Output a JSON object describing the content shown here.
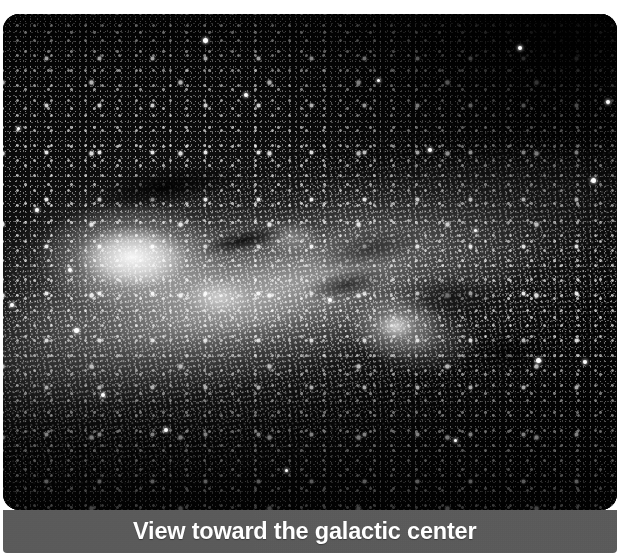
{
  "figure": {
    "kind": "astrophotograph",
    "color_mode": "grayscale",
    "caption": "View toward the galactic center",
    "plate": {
      "background_color": "#050505",
      "corner_radius_px": 16,
      "left": 3,
      "top": 14,
      "width": 614,
      "height": 496
    },
    "caption_bar": {
      "background_color": "#595959",
      "text_color": "#ffffff",
      "left": 3,
      "top": 510,
      "width": 614,
      "height": 43
    },
    "page_background_color": "#ffffff"
  },
  "scene": {
    "band": {
      "name": "milky-way-band",
      "orientation": "upper-left to lower-right",
      "tilt_degrees": -13,
      "brightness": "bright"
    },
    "features": [
      {
        "name": "galactic-bulge",
        "label": "bright galactic bulge",
        "position": "left of center",
        "brightness": "brightest"
      },
      {
        "name": "bulge-lobe",
        "label": "secondary bulge lobe",
        "position": "below and right of bulge",
        "brightness": "bright"
      },
      {
        "name": "star-cloud-right",
        "label": "bright star cloud",
        "position": "right of center",
        "brightness": "bright"
      },
      {
        "name": "dust-lane-upper",
        "label": "dark dust lane",
        "position": "upper left",
        "brightness": "dark"
      },
      {
        "name": "dust-lane-central",
        "label": "central dark rift",
        "position": "center",
        "brightness": "dark"
      },
      {
        "name": "dark-sky-upper-right",
        "label": "sparse dark sky",
        "position": "upper right",
        "brightness": "darkest"
      }
    ],
    "bright_stars": [
      {
        "x": 205,
        "y": 40,
        "size": 5
      },
      {
        "x": 520,
        "y": 48,
        "size": 4
      },
      {
        "x": 246,
        "y": 95,
        "size": 4
      },
      {
        "x": 608,
        "y": 102,
        "size": 4
      },
      {
        "x": 593,
        "y": 180,
        "size": 5
      },
      {
        "x": 37,
        "y": 210,
        "size": 4
      },
      {
        "x": 70,
        "y": 270,
        "size": 4
      },
      {
        "x": 12,
        "y": 305,
        "size": 4
      },
      {
        "x": 76,
        "y": 330,
        "size": 5
      },
      {
        "x": 538,
        "y": 360,
        "size": 5
      },
      {
        "x": 585,
        "y": 362,
        "size": 4
      },
      {
        "x": 103,
        "y": 395,
        "size": 4
      },
      {
        "x": 330,
        "y": 300,
        "size": 4
      },
      {
        "x": 430,
        "y": 150,
        "size": 4
      },
      {
        "x": 166,
        "y": 430,
        "size": 4
      },
      {
        "x": 286,
        "y": 470,
        "size": 3
      },
      {
        "x": 455,
        "y": 440,
        "size": 3
      },
      {
        "x": 18,
        "y": 128,
        "size": 3
      },
      {
        "x": 378,
        "y": 80,
        "size": 3
      },
      {
        "x": 475,
        "y": 230,
        "size": 3
      }
    ]
  }
}
